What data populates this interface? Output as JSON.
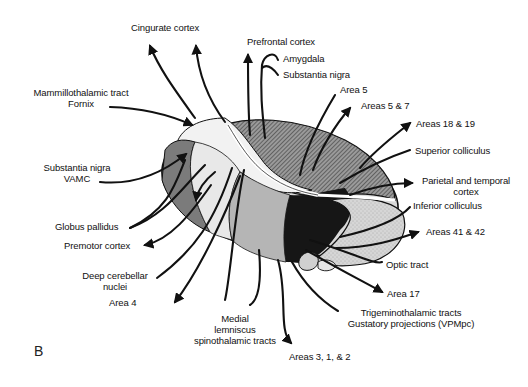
{
  "panel_letter": "B",
  "diagram": {
    "colors": {
      "ink": "#111111",
      "dark": "#2a2a2a",
      "mid": "#7a7a7a",
      "light": "#cfcfcf",
      "pale": "#ececec",
      "background": "#ffffff"
    }
  },
  "labels": {
    "cingulate_cortex": "Cingurate cortex",
    "prefrontal_cortex": "Prefrontal cortex",
    "amygdala": "Amygdala",
    "substantia_nigra_top": "Substantia nigra",
    "area5": "Area 5",
    "areas_5_7": "Areas 5 & 7",
    "areas_18_19": "Areas 18 & 19",
    "superior_colliculus": "Superior colliculus",
    "parietal_temporal_1": "Parietal and temporal",
    "parietal_temporal_2": "cortex",
    "inferior_colliculus": "Inferior colliculus",
    "areas_41_42": "Areas 41 & 42",
    "optic_tract": "Optic tract",
    "area17": "Area 17",
    "trigeminothalamic": "Trigeminothalamic tracts",
    "gustatory": "Gustatory projections (VPMpc)",
    "areas_3_1_2": "Areas 3, 1, & 2",
    "medial_1": "Medial",
    "medial_2": "lemniscus",
    "medial_3": "spinothalamic tracts",
    "area4": "Area 4",
    "deep_cerebellar_1": "Deep cerebellar",
    "deep_cerebellar_2": "nuclei",
    "premotor_cortex": "Premotor cortex",
    "globus_pallidus": "Globus pallidus",
    "substantia_nigra_left_1": "Substantia nigra",
    "substantia_nigra_left_2": "VAMC",
    "mammillothalamic_1": "Mammillothalamic  tract",
    "mammillothalamic_2": "Fornix"
  }
}
